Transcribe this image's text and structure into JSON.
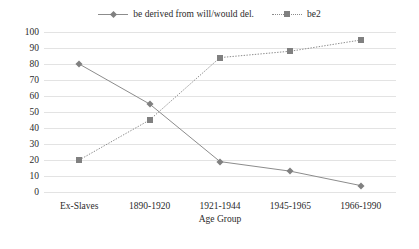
{
  "chart_data": {
    "type": "line",
    "title": "",
    "xlabel": "Age Group",
    "ylabel": "",
    "categories": [
      "Ex-Slaves",
      "1890-1920",
      "1921-1944",
      "1945-1965",
      "1966-1990"
    ],
    "series": [
      {
        "name": "be derived from will/would del.",
        "values": [
          80,
          55,
          19,
          13,
          4
        ],
        "marker": "diamond",
        "linestyle": "solid",
        "color": "#8c8c8c"
      },
      {
        "name": "be2",
        "values": [
          20,
          45,
          84,
          88,
          95
        ],
        "marker": "square",
        "linestyle": "dotted",
        "color": "#8c8c8c"
      }
    ],
    "ylim": [
      0,
      100
    ],
    "ytick_values": [
      0,
      10,
      20,
      30,
      40,
      50,
      60,
      70,
      80,
      90,
      100
    ],
    "ytick_labels": [
      "0",
      "10",
      "20",
      "30",
      "40",
      "50",
      "60",
      "70",
      "80",
      "90",
      "100"
    ],
    "grid": true,
    "legend_position": "top-center"
  },
  "legend": {
    "items": [
      {
        "label": "be derived from will/would del."
      },
      {
        "label": "be2"
      }
    ]
  },
  "colors": {
    "series": "#8c8c8c",
    "marker": "#808080",
    "grid": "#e3e3e3",
    "text": "#2b2b2b"
  }
}
